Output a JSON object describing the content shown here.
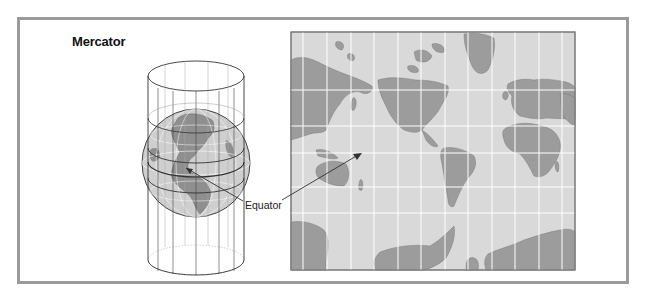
{
  "figure": {
    "title": "Mercator",
    "equator_label": "Equator",
    "colors": {
      "frame_border": "#9a9a9a",
      "ocean": "#d9d9d9",
      "land": "#9c9c9c",
      "gridline": "#ffffff",
      "cylinder_line": "#333333",
      "globe_ocean": "#cfcfcf",
      "globe_land": "#8f8f8f"
    }
  },
  "globe_diagram": {
    "description": "Globe inside a projection cylinder"
  },
  "map": {
    "projection": "Mercator world map",
    "grid": {
      "meridians": 12,
      "parallels": 5
    }
  }
}
